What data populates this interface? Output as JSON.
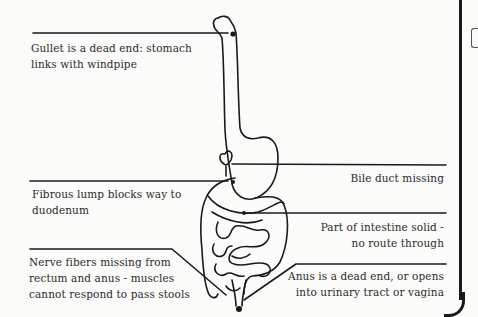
{
  "diagram": {
    "type": "anatomical illustration - digestive tract birth defects",
    "labels": {
      "gullet": [
        "Gullet is a dead end: stomach",
        "links with windpipe"
      ],
      "fibrous_lump": [
        "Fibrous lump blocks way to",
        "duodenum"
      ],
      "nerve_fibers": [
        "Nerve fibers missing from",
        "rectum and anus - muscles",
        "cannot respond to pass stools"
      ],
      "bile_duct": [
        "Bile duct missing"
      ],
      "intestine_solid": [
        "Part of intestine solid -",
        "no route through"
      ],
      "anus": [
        "Anus is a dead end, or opens",
        "into urinary tract or vagina"
      ]
    },
    "colors": {
      "line": "#1a1a1a",
      "text": "#2b2b2b",
      "background": "#fbfbfa"
    }
  }
}
